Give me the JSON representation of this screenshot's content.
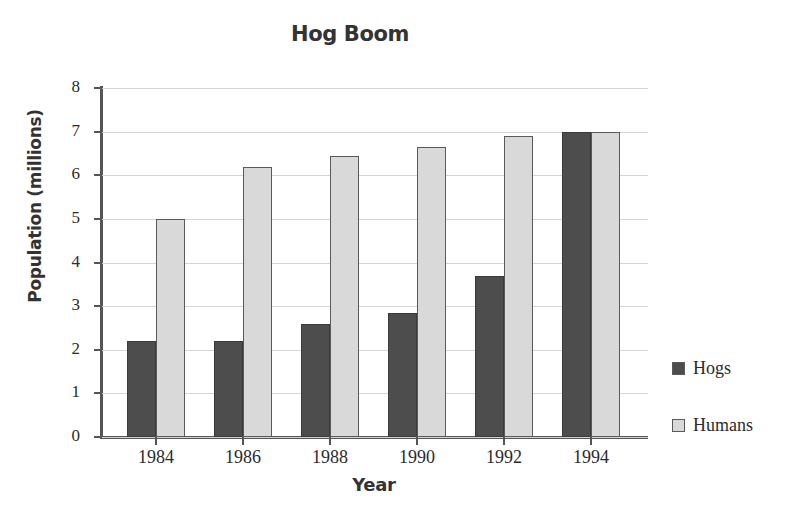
{
  "chart_data": {
    "type": "bar",
    "title": "Hog Boom",
    "xlabel": "Year",
    "ylabel": "Population (millions)",
    "categories": [
      "1984",
      "1986",
      "1988",
      "1990",
      "1992",
      "1994"
    ],
    "series": [
      {
        "name": "Hogs",
        "color": "#4d4d4d",
        "values": [
          2.2,
          2.2,
          2.6,
          2.85,
          3.7,
          7.0
        ]
      },
      {
        "name": "Humans",
        "color": "#d9d9d9",
        "values": [
          5.0,
          6.2,
          6.45,
          6.65,
          6.9,
          7.0
        ]
      }
    ],
    "ylim": [
      0,
      8
    ],
    "ytick_labels": [
      "8",
      "7",
      "6",
      "5",
      "4",
      "3",
      "2",
      "1",
      "0"
    ],
    "ytick_values": [
      8,
      7,
      6,
      5,
      4,
      3,
      2,
      1,
      0
    ],
    "grid": true,
    "legend_position": "right"
  },
  "legend": {
    "items": [
      {
        "label": "Hogs",
        "swatch_color": "#4d4d4d"
      },
      {
        "label": "Humans",
        "swatch_color": "#d9d9d9"
      }
    ]
  },
  "colors": {
    "hogs": "#4d4d4d",
    "humans": "#d9d9d9",
    "axis": "#555555",
    "grid": "#d5d5d5",
    "text": "#2b2b2b",
    "background": "#ffffff"
  }
}
